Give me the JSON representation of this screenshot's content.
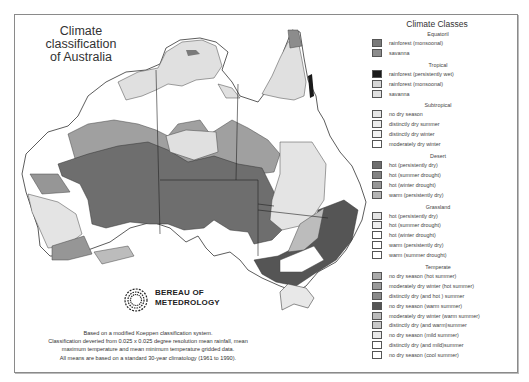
{
  "map": {
    "title_line1": "Climate classification",
    "title_line2": "of Australia",
    "logo_line1": "BEREAU OF",
    "logo_line2": "METEDROLOGY",
    "caption": [
      "Based on a modified Koeppen classification system.",
      "Classification deveried from 0.025 x 0.025 degree resolution mean rainfall, mean",
      "maximum temperature and mean minimum temperature gridded data.",
      "All means are based on a standard 30-year climatology (1961 to 1990)."
    ]
  },
  "legend": {
    "title": "Climate Classes",
    "groups": [
      {
        "name": "Equatoril",
        "items": [
          {
            "label": "rainforest (monsoonal)",
            "color": "#7a7a7a"
          },
          {
            "label": "savanna",
            "color": "#8c8c8c"
          }
        ]
      },
      {
        "name": "Tropical",
        "items": [
          {
            "label": "rainforest (persistently wet)",
            "color": "#1a1a1a"
          },
          {
            "label": "rainforest (monsoonal)",
            "color": "#d6d6d6"
          },
          {
            "label": "savanna",
            "color": "#e0e0e0"
          }
        ]
      },
      {
        "name": "Subtropical",
        "items": [
          {
            "label": "no dry season",
            "color": "#e6e6e6"
          },
          {
            "label": "distinctly dry summer",
            "color": "#ececec"
          },
          {
            "label": "distinctly dry winter",
            "color": "#f2f2f2"
          },
          {
            "label": "moderately dry winter",
            "color": "#ffffff"
          }
        ]
      },
      {
        "name": "Desert",
        "items": [
          {
            "label": "hot (persistently dry)",
            "color": "#6e6e6e"
          },
          {
            "label": "hot (summer drought)",
            "color": "#828282"
          },
          {
            "label": "hot (winter drought)",
            "color": "#969696"
          },
          {
            "label": "warm (persistently dry)",
            "color": "#b4b4b4"
          }
        ]
      },
      {
        "name": "Grassland",
        "items": [
          {
            "label": "hot (persistently dry)",
            "color": "#e4e4e4"
          },
          {
            "label": "hot (summer drought)",
            "color": "#eeeeee"
          },
          {
            "label": "hot (winter drought)",
            "color": "#ffffff"
          },
          {
            "label": "warm (persistently dry)",
            "color": "#ffffff"
          },
          {
            "label": "warm (summer drought)",
            "color": "#ffffff"
          }
        ]
      },
      {
        "name": "Temperate",
        "items": [
          {
            "label": "no dry season (hot summer)",
            "color": "#aaaaaa"
          },
          {
            "label": "moderately dry winter (hot summer)",
            "color": "#9a9a9a"
          },
          {
            "label": "distinctly dry (and hot ) summer",
            "color": "#8a8a8a"
          },
          {
            "label": "no dry season (warm summer)",
            "color": "#555555"
          },
          {
            "label": "moderately dry winter (warm summer)",
            "color": "#bcbcbc"
          },
          {
            "label": "distinctly dry (and warm)summer",
            "color": "#c8c8c8"
          },
          {
            "label": "no dry season (mild summer)",
            "color": "#e8e8e8"
          },
          {
            "label": "distinctly dry (and mild)summer",
            "color": "#ffffff"
          },
          {
            "label": "no dry season (cool summer)",
            "color": "#ffffff"
          }
        ]
      }
    ]
  }
}
